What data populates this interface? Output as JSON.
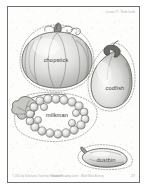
{
  "document": {
    "type": "worksheet-page",
    "title": "Vocabulary picture cut-out worksheet",
    "header_right": "Lesson 27 · Word Cards",
    "footer_left": "© 2011 by Scholastic Teaching Resources",
    "footer_center": "Guided Reading Level · Word Work Activity",
    "page_number": "27",
    "background_color": "#fdfdfc",
    "border_color": "#6e6e6e",
    "ink_color": "#2f2f2f"
  },
  "cutouts": [
    {
      "id": "pumpkin",
      "illustration": "pumpkin",
      "label": "chopstick",
      "cut_line": "dotted"
    },
    {
      "id": "eggplant",
      "illustration": "eggplant",
      "label": "codfish",
      "cut_line": "dotted"
    },
    {
      "id": "grapes",
      "illustration": "grape-cluster",
      "label": "milkman",
      "cut_line": "dotted"
    },
    {
      "id": "squash",
      "illustration": "squash",
      "label": "dustbin",
      "cut_line": "dotted"
    }
  ]
}
